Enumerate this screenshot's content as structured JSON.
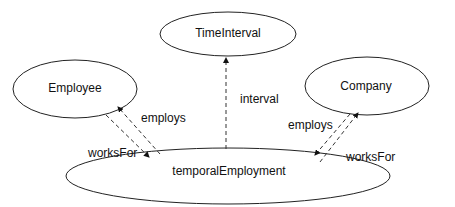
{
  "diagram": {
    "nodes": [
      {
        "id": "TimeInterval",
        "label": "TimeInterval",
        "cx": 228,
        "cy": 34,
        "rx": 68,
        "ry": 22
      },
      {
        "id": "Employee",
        "label": "Employee",
        "cx": 75,
        "cy": 89,
        "rx": 62,
        "ry": 29
      },
      {
        "id": "Company",
        "label": "Company",
        "cx": 367,
        "cy": 86,
        "rx": 62,
        "ry": 29
      },
      {
        "id": "temporalEmployment",
        "label": "temporalEmployment",
        "cx": 228,
        "cy": 176,
        "rx": 162,
        "ry": 28
      }
    ],
    "edges": [
      {
        "label": "interval",
        "from": "temporalEmployment",
        "to": "TimeInterval",
        "style": "dashed"
      },
      {
        "label": "employs",
        "from": "temporalEmployment",
        "to": "Employee",
        "style": "dashed"
      },
      {
        "label": "worksFor",
        "from": "Employee",
        "to": "temporalEmployment",
        "style": "dashed"
      },
      {
        "label": "employs",
        "from": "Company",
        "to": "temporalEmployment",
        "style": "dashed"
      },
      {
        "label": "worksFor",
        "from": "temporalEmployment",
        "to": "Company",
        "style": "dashed"
      }
    ],
    "edge_labels": {
      "interval": "interval",
      "employs_left": "employs",
      "worksFor_left": "worksFor",
      "employs_right": "employs",
      "worksFor_right": "worksFor"
    },
    "colors": {
      "stroke": "#222222",
      "text": "#111111",
      "background": "#ffffff"
    }
  }
}
